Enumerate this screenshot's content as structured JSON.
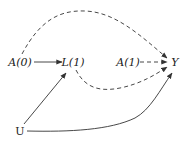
{
  "diagram": {
    "type": "causal-dag",
    "nodes": [
      {
        "id": "A0",
        "label": "A(0)",
        "italic": true,
        "x": 20,
        "y": 62
      },
      {
        "id": "L1",
        "label": "L(1)",
        "italic": true,
        "x": 72,
        "y": 62
      },
      {
        "id": "A1",
        "label": "A(1)",
        "italic": true,
        "x": 128,
        "y": 62
      },
      {
        "id": "Y",
        "label": "Y",
        "italic": true,
        "x": 175,
        "y": 62
      },
      {
        "id": "U",
        "label": "U",
        "italic": false,
        "x": 20,
        "y": 131
      }
    ],
    "edges": [
      {
        "from": "A0",
        "to": "L1",
        "style": "solid"
      },
      {
        "from": "A0",
        "to": "Y",
        "style": "dashed",
        "curve": "up"
      },
      {
        "from": "A1",
        "to": "Y",
        "style": "dashed"
      },
      {
        "from": "L1",
        "to": "Y",
        "style": "dashed",
        "curve": "down"
      },
      {
        "from": "U",
        "to": "L1",
        "style": "solid"
      },
      {
        "from": "U",
        "to": "Y",
        "style": "solid",
        "curve": "down"
      }
    ],
    "colors": {
      "stroke": "#333333",
      "text": "#222222",
      "background": "#ffffff"
    }
  }
}
